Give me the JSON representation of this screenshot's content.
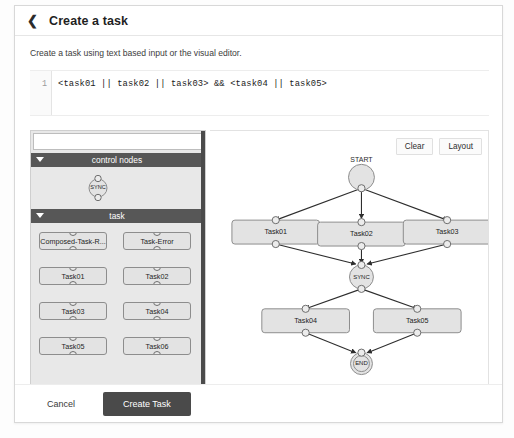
{
  "header": {
    "back_icon": "chevron-left-icon",
    "title": "Create a task"
  },
  "description": "Create a task using text based input or the visual editor.",
  "editor": {
    "line_number": "1",
    "code": "<task01 || task02 || task03> && <task04 || task05>"
  },
  "palette": {
    "search_value": "",
    "search_placeholder": "",
    "groups": [
      {
        "title": "control nodes",
        "caret": "caret-down-icon",
        "nodes": [
          {
            "label": "SYNC",
            "shape": "circle"
          }
        ]
      },
      {
        "title": "task",
        "caret": "caret-down-icon",
        "nodes": [
          {
            "label": "Composed-Task-R...",
            "shape": "rect"
          },
          {
            "label": "Task-Error",
            "shape": "rect"
          },
          {
            "label": "Task01",
            "shape": "rect"
          },
          {
            "label": "Task02",
            "shape": "rect"
          },
          {
            "label": "Task03",
            "shape": "rect"
          },
          {
            "label": "Task04",
            "shape": "rect"
          },
          {
            "label": "Task05",
            "shape": "rect"
          },
          {
            "label": "Task06",
            "shape": "rect"
          }
        ]
      }
    ]
  },
  "canvas": {
    "tools": [
      {
        "label": "Clear",
        "name": "clear-button"
      },
      {
        "label": "Layout",
        "name": "layout-button"
      }
    ],
    "graph": {
      "start_label": "START",
      "sync_label": "SYNC",
      "end_label": "END",
      "nodes": [
        {
          "id": "start",
          "label": "START",
          "type": "start"
        },
        {
          "id": "task01",
          "label": "Task01",
          "type": "task"
        },
        {
          "id": "task02",
          "label": "Task02",
          "type": "task"
        },
        {
          "id": "task03",
          "label": "Task03",
          "type": "task"
        },
        {
          "id": "sync",
          "label": "SYNC",
          "type": "sync"
        },
        {
          "id": "task04",
          "label": "Task04",
          "type": "task"
        },
        {
          "id": "task05",
          "label": "Task05",
          "type": "task"
        },
        {
          "id": "end",
          "label": "END",
          "type": "end"
        }
      ],
      "edges": [
        {
          "from": "start",
          "to": "task01"
        },
        {
          "from": "start",
          "to": "task02"
        },
        {
          "from": "start",
          "to": "task03"
        },
        {
          "from": "task01",
          "to": "sync"
        },
        {
          "from": "task02",
          "to": "sync"
        },
        {
          "from": "task03",
          "to": "sync"
        },
        {
          "from": "sync",
          "to": "task04"
        },
        {
          "from": "sync",
          "to": "task05"
        },
        {
          "from": "task04",
          "to": "end"
        },
        {
          "from": "task05",
          "to": "end"
        }
      ]
    }
  },
  "footer": {
    "cancel_label": "Cancel",
    "create_label": "Create Task"
  },
  "colors": {
    "group_header_bg": "#575757",
    "palette_bg": "#e8e8e8",
    "node_fill": "#e3e3e3",
    "node_stroke": "#8d8d8d",
    "primary_button_bg": "#4a4a4a"
  }
}
